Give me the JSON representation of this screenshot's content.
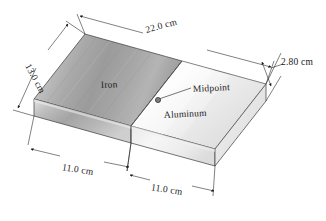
{
  "figure": {
    "object_name": "rectangular-slab",
    "materials": {
      "left": "Iron",
      "right": "Aluminum"
    },
    "annotations": {
      "midpoint": "Midpoint"
    },
    "dimensions": {
      "length": "22.0 cm",
      "width": "13.0 cm",
      "thickness": "2.80 cm",
      "bottom_left_segment": "11.0 cm",
      "bottom_right_segment": "11.0 cm"
    },
    "colors": {
      "line": "#1a1a1a",
      "iron_light": "#d8d8d8",
      "iron_mid": "#a8a8a8",
      "iron_dark": "#8c8c8c",
      "aluminum_light": "#fbfbfb",
      "aluminum_mid": "#e9e9e9",
      "aluminum_dark": "#cfcfcf",
      "front_face": "#bdbdbd",
      "side_face": "#ededed",
      "background": "#ffffff"
    }
  }
}
